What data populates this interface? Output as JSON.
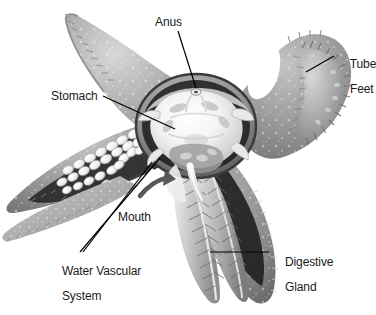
{
  "figure": {
    "background_color": "#ffffff",
    "text_color": "#1a1a1a",
    "leader_line_color": "#000000",
    "width": 376,
    "height": 315
  },
  "labels": {
    "anus": "Anus",
    "tube_feet_line1": "Tube",
    "tube_feet_line2": "Feet",
    "stomach": "Stomach",
    "mouth": "Mouth",
    "water_vascular_line1": "Water Vascular",
    "water_vascular_line2": "System",
    "digestive_gland_line1": "Digestive",
    "digestive_gland_line2": "Gland"
  },
  "artwork": {
    "style": "grayscale airbrush illustration",
    "body_gray_mid": "#9a9a9a",
    "body_gray_light": "#c9c9c9",
    "body_gray_dark": "#6d6d6d",
    "cavity_dark": "#1c1c1c",
    "organ_light": "#f2f2f2",
    "organ_shadow": "#b5b5b5",
    "speckle_color": "#e8e8e8",
    "parts": [
      "central disc",
      "five arms",
      "stomach",
      "anus",
      "mouth",
      "tube feet",
      "ampullae",
      "digestive gland"
    ]
  }
}
